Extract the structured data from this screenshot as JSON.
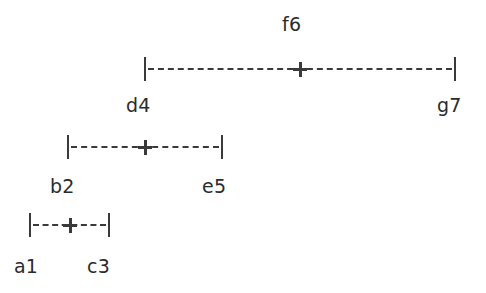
{
  "figure": {
    "type": "interval-range-diagram",
    "background_color": "#ffffff",
    "stroke_color": "#3a3a3a",
    "text_color": "#2b2b2b"
  },
  "intervals": [
    {
      "id": "top",
      "left_label": "d4",
      "right_label": "g7",
      "center_label": "f6",
      "x_start": 144,
      "x_end": 456,
      "y": 57,
      "center_x": 300
    },
    {
      "id": "middle",
      "left_label": "b2",
      "right_label": "e5",
      "center_label": "",
      "x_start": 67,
      "x_end": 223,
      "y": 135,
      "center_x": 145
    },
    {
      "id": "bottom",
      "left_label": "a1",
      "right_label": "c3",
      "center_label": "",
      "x_start": 29,
      "x_end": 110,
      "y": 213,
      "center_x": 70
    }
  ],
  "labels": [
    {
      "name": "label-f6",
      "text": "f6",
      "x": 282,
      "y": 13
    },
    {
      "name": "label-d4",
      "text": "d4",
      "x": 126,
      "y": 94
    },
    {
      "name": "label-g7",
      "text": "g7",
      "x": 437,
      "y": 94
    },
    {
      "name": "label-b2",
      "text": "b2",
      "x": 50,
      "y": 175
    },
    {
      "name": "label-e5",
      "text": "e5",
      "x": 202,
      "y": 175
    },
    {
      "name": "label-a1",
      "text": "a1",
      "x": 14,
      "y": 255
    },
    {
      "name": "label-c3",
      "text": "c3",
      "x": 87,
      "y": 255
    }
  ]
}
